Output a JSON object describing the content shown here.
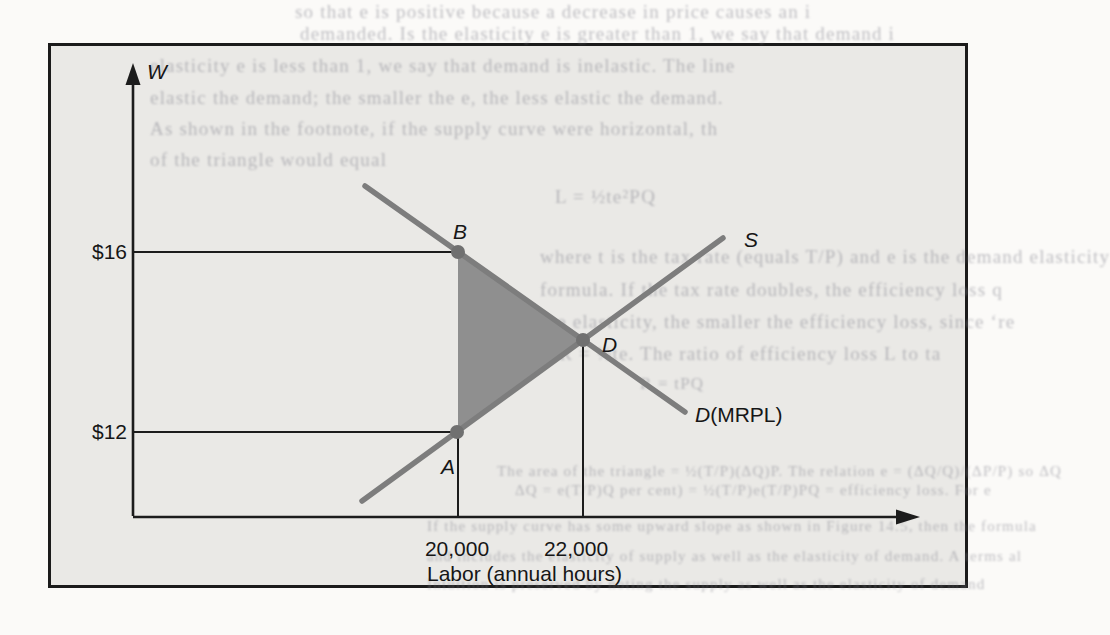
{
  "figure": {
    "axis": {
      "y_label": "W",
      "x_title": "Labor (annual hours)"
    },
    "prices": {
      "p16": "$16",
      "p12": "$12"
    },
    "quantities": {
      "q1": "20,000",
      "q2": "22,000"
    },
    "points": {
      "a": "A",
      "b": "B",
      "d": "D"
    },
    "curves": {
      "supply": "S",
      "demand_d": "D",
      "demand_suffix": "(MRPL)"
    }
  },
  "chart_data": {
    "type": "line",
    "title": "",
    "xlabel": "Labor (annual hours)",
    "ylabel": "W",
    "x_ticks": [
      {
        "value": 20000,
        "label": "20,000"
      },
      {
        "value": 22000,
        "label": "22,000"
      }
    ],
    "y_ticks": [
      {
        "value": 16,
        "label": "$16"
      },
      {
        "value": 12,
        "label": "$12"
      }
    ],
    "axis_ranges": {
      "x": [
        14800,
        25000
      ],
      "y": [
        10.1,
        20
      ]
    },
    "grid": false,
    "legend_position": "labels-on-curves",
    "series": [
      {
        "name": "S",
        "role": "supply",
        "color": "#7d7d7d",
        "points": [
          [
            18460,
            10.5
          ],
          [
            20000,
            12
          ],
          [
            22000,
            14
          ],
          [
            24240,
            16.4
          ]
        ]
      },
      {
        "name": "D(MRPL)",
        "role": "demand",
        "color": "#7d7d7d",
        "points": [
          [
            18510,
            17.5
          ],
          [
            20000,
            16
          ],
          [
            22000,
            14
          ],
          [
            23630,
            12.4
          ]
        ]
      }
    ],
    "key_points": [
      {
        "label": "B",
        "x": 20000,
        "y": 16
      },
      {
        "label": "A",
        "x": 20000,
        "y": 12
      },
      {
        "label": "D",
        "x": 22000,
        "y": 14
      }
    ],
    "shaded_region": {
      "vertices": [
        [
          20000,
          16
        ],
        [
          20000,
          12
        ],
        [
          22000,
          14
        ]
      ],
      "color": "#8f8f8f",
      "meaning": "efficiency-loss (deadweight) triangle B-A-D"
    },
    "reference_lines": [
      {
        "type": "horizontal",
        "at": 16,
        "to_point": "B"
      },
      {
        "type": "horizontal",
        "at": 12,
        "to_point": "A"
      },
      {
        "type": "vertical",
        "at": 20000,
        "from_point": "A"
      },
      {
        "type": "vertical",
        "at": 22000,
        "from_point": "D"
      }
    ]
  },
  "background_text": {
    "fragments": [
      {
        "x": 295,
        "y": 1,
        "size": 19,
        "text": "so that e is positive because a decrease in price causes an i"
      },
      {
        "x": 300,
        "y": 23,
        "size": 19,
        "text": "demanded. Is the elasticity e is greater than 1, we say that demand i"
      },
      {
        "x": 150,
        "y": 55,
        "size": 19,
        "text": "elasticity e is less than 1, we say that demand is inelastic. The line"
      },
      {
        "x": 150,
        "y": 87,
        "size": 19,
        "text": "elastic the demand; the smaller the e, the less elastic the demand."
      },
      {
        "x": 150,
        "y": 118,
        "size": 19,
        "text": "As shown in the footnote, if the supply curve were horizontal, th"
      },
      {
        "x": 150,
        "y": 149,
        "size": 19,
        "text": "of the triangle would equal"
      },
      {
        "x": 555,
        "y": 186,
        "size": 19,
        "text": "L = ½te²PQ"
      },
      {
        "x": 540,
        "y": 246,
        "size": 19,
        "text": "where t is the tax rate (equals T/P) and e is the demand elasticity"
      },
      {
        "x": 540,
        "y": 279,
        "size": 19,
        "text": "formula. If the tax rate doubles, the efficiency loss q"
      },
      {
        "x": 540,
        "y": 311,
        "size": 19,
        "text": "the elasticity, the smaller the efficiency loss, since ‘re"
      },
      {
        "x": 540,
        "y": 343,
        "size": 19,
        "text": "L/R = ½te. The ratio of efficiency loss L to ta"
      },
      {
        "x": 640,
        "y": 374,
        "size": 17,
        "text": "R = tPQ"
      },
      {
        "x": 497,
        "y": 463,
        "size": 15,
        "text": "The area of the triangle = ½(T/P)(ΔQ)P. The relation e = (ΔQ/Q)/(ΔP/P) so ΔQ"
      },
      {
        "x": 515,
        "y": 482,
        "size": 15,
        "text": "ΔQ = e(T/P)Q per cent) = ½(T/P)e(T/P)PQ = efficiency loss. For e"
      },
      {
        "x": 427,
        "y": 518,
        "size": 15,
        "text": "If the supply curve has some upward slope as shown in Figure 14.5, then the formula"
      },
      {
        "x": 427,
        "y": 548,
        "size": 15,
        "text": "and includes the elasticity of supply as well as the elasticity of demand. A terms al"
      },
      {
        "x": 427,
        "y": 576,
        "size": 15,
        "text": "Intuition is preserved by noting the supply as well as the elasticity of demand"
      }
    ]
  }
}
